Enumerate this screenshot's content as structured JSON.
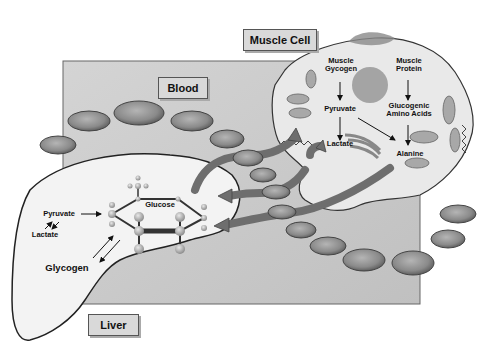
{
  "labels": {
    "muscle_cell": "Muscle Cell",
    "blood": "Blood",
    "liver": "Liver"
  },
  "muscle": {
    "glycogen_line1": "Muscle",
    "glycogen_line2": "Gycogen",
    "protein_line1": "Muscle",
    "protein_line2": "Protein",
    "pyruvate": "Pyruvate",
    "amino_line1": "Glucogenic",
    "amino_line2": "Amino Acids",
    "lactate": "Lactate",
    "alanine": "Alanine"
  },
  "liver_panel": {
    "pyruvate": "Pyruvate",
    "lactate": "Lactate",
    "glycogen": "Glycogen",
    "glucose": "Glucose"
  },
  "colors": {
    "blood_bg": "#c9c9c9",
    "cell_fill": "#e9e9e9",
    "liver_fill": "#f3f3f3",
    "arrow": "#6e6e6e",
    "rbc": "#8f8f8f"
  }
}
